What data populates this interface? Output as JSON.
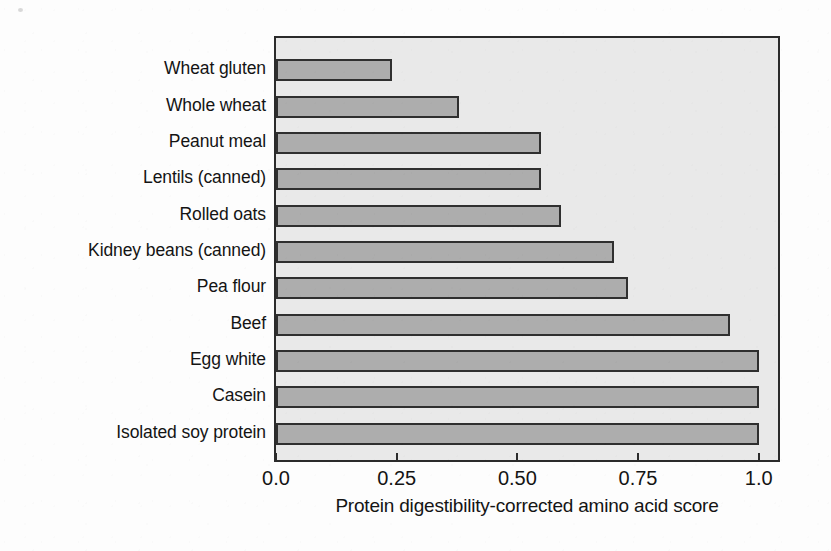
{
  "chart_data": {
    "type": "bar",
    "orientation": "horizontal",
    "title": "",
    "xlabel": "Protein digestibility-corrected amino acid score",
    "ylabel": "",
    "xlim": [
      0.0,
      1.04
    ],
    "xticks": [
      0.0,
      0.25,
      0.5,
      0.75,
      1.0
    ],
    "xtick_labels": [
      "0.0",
      "0.25",
      "0.50",
      "0.75",
      "1.0"
    ],
    "grid": false,
    "legend": null,
    "categories": [
      "Wheat gluten",
      "Whole wheat",
      "Peanut meal",
      "Lentils (canned)",
      "Rolled oats",
      "Kidney beans (canned)",
      "Pea flour",
      "Beef",
      "Egg white",
      "Casein",
      "Isolated soy protein"
    ],
    "values": [
      0.24,
      0.38,
      0.55,
      0.55,
      0.59,
      0.7,
      0.73,
      0.94,
      1.0,
      1.0,
      1.0
    ],
    "colors": {
      "bar_fill": "#adadad",
      "bar_edge": "#2f2f2f",
      "plot_background": "#e9e9e9",
      "plot_border": "#2b2b2b",
      "figure_background": "#fdfdfd",
      "text": "#141414"
    }
  }
}
